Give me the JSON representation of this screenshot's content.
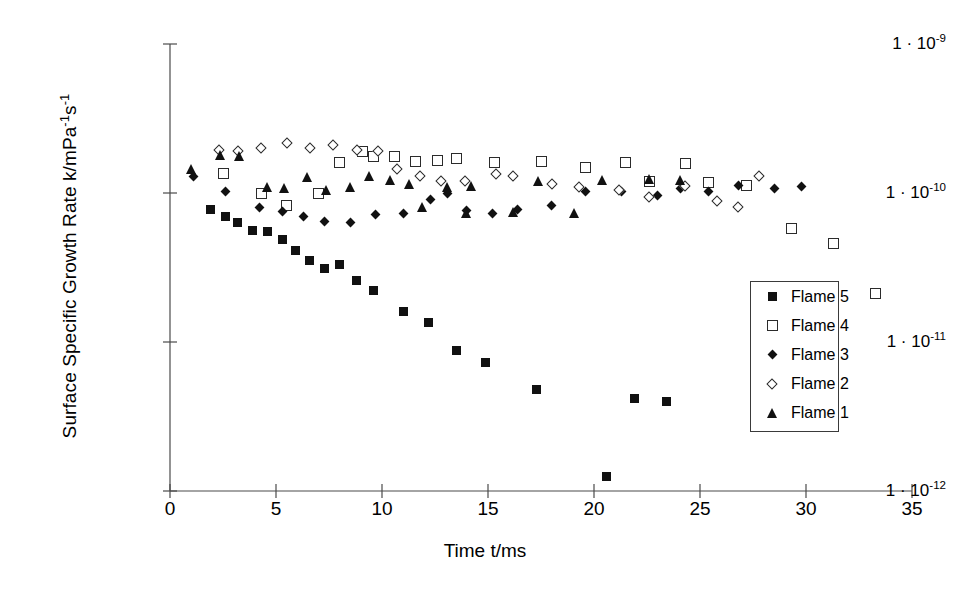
{
  "chart_data": {
    "type": "scatter",
    "title": "",
    "xlabel": "Time t/ms",
    "ylabel": "Surface Specific Growth Rate k/mPa-1s-1",
    "ylabel_parts": [
      {
        "t": "Surface Specific Growth Rate k/mPa"
      },
      {
        "t": "-1",
        "sup": true
      },
      {
        "t": "s"
      },
      {
        "t": "-1",
        "sup": true
      }
    ],
    "xlim": [
      0,
      35
    ],
    "ylim": [
      1e-12,
      1e-09
    ],
    "yscale": "log",
    "xticks": [
      0,
      5,
      10,
      15,
      20,
      25,
      30,
      35
    ],
    "xticklabels": [
      "0",
      "5",
      "10",
      "15",
      "20",
      "25",
      "30",
      "35"
    ],
    "yticks": [
      1e-09,
      1e-10,
      1e-11,
      1e-12
    ],
    "yticklabels": [
      {
        "mantissa": "1 · 10",
        "exp": "-9"
      },
      {
        "mantissa": "1 · 10",
        "exp": "-10"
      },
      {
        "mantissa": "1 · 10",
        "exp": "-11"
      },
      {
        "mantissa": "1 · 10",
        "exp": "-12"
      }
    ],
    "grid": false,
    "legend_position": "center-right",
    "series": [
      {
        "name": "Flame 5",
        "marker": "filled-square",
        "points": [
          [
            1.9,
            7.8e-11
          ],
          [
            2.6,
            7e-11
          ],
          [
            3.2,
            6.3e-11
          ],
          [
            3.9,
            5.6e-11
          ],
          [
            4.6,
            5.5e-11
          ],
          [
            5.3,
            4.9e-11
          ],
          [
            5.9,
            4.1e-11
          ],
          [
            6.6,
            3.5e-11
          ],
          [
            7.3,
            3.1e-11
          ],
          [
            8.0,
            3.3e-11
          ],
          [
            8.8,
            2.6e-11
          ],
          [
            9.6,
            2.2e-11
          ],
          [
            11.0,
            1.6e-11
          ],
          [
            12.2,
            1.35e-11
          ],
          [
            13.5,
            8.8e-12
          ],
          [
            14.9,
            7.3e-12
          ],
          [
            17.3,
            4.8e-12
          ],
          [
            20.6,
            1.25e-12
          ],
          [
            21.9,
            4.2e-12
          ],
          [
            23.4,
            4e-12
          ]
        ]
      },
      {
        "name": "Flame 4",
        "marker": "open-square",
        "points": [
          [
            2.5,
            1.35e-10
          ],
          [
            4.3,
            1e-10
          ],
          [
            5.5,
            8.3e-11
          ],
          [
            7.0,
            9.9e-11
          ],
          [
            8.0,
            1.6e-10
          ],
          [
            9.1,
            1.9e-10
          ],
          [
            9.6,
            1.75e-10
          ],
          [
            10.6,
            1.75e-10
          ],
          [
            11.6,
            1.62e-10
          ],
          [
            12.6,
            1.65e-10
          ],
          [
            13.5,
            1.7e-10
          ],
          [
            15.3,
            1.6e-10
          ],
          [
            17.5,
            1.63e-10
          ],
          [
            19.6,
            1.48e-10
          ],
          [
            21.5,
            1.6e-10
          ],
          [
            22.6,
            1.2e-10
          ],
          [
            24.3,
            1.58e-10
          ],
          [
            25.4,
            1.18e-10
          ],
          [
            27.2,
            1.12e-10
          ],
          [
            29.3,
            5.8e-11
          ],
          [
            31.3,
            4.6e-11
          ],
          [
            33.3,
            2.1e-11
          ]
        ]
      },
      {
        "name": "Flame 3",
        "marker": "filled-diamond",
        "points": [
          [
            1.1,
            1.3e-10
          ],
          [
            2.6,
            1.02e-10
          ],
          [
            4.2,
            8e-11
          ],
          [
            5.3,
            7.5e-11
          ],
          [
            6.3,
            7e-11
          ],
          [
            7.3,
            6.4e-11
          ],
          [
            8.5,
            6.3e-11
          ],
          [
            9.7,
            7.2e-11
          ],
          [
            11.0,
            7.3e-11
          ],
          [
            12.3,
            9e-11
          ],
          [
            13.1,
            1e-10
          ],
          [
            14.0,
            7.6e-11
          ],
          [
            15.2,
            7.3e-11
          ],
          [
            16.4,
            7.8e-11
          ],
          [
            18.0,
            8.3e-11
          ],
          [
            19.6,
            1.03e-10
          ],
          [
            21.3,
            1.02e-10
          ],
          [
            23.0,
            9.6e-11
          ],
          [
            24.1,
            1.08e-10
          ],
          [
            25.4,
            1.02e-10
          ],
          [
            26.8,
            1.12e-10
          ],
          [
            28.5,
            1.08e-10
          ],
          [
            29.8,
            1.1e-10
          ]
        ]
      },
      {
        "name": "Flame 2",
        "marker": "open-diamond",
        "points": [
          [
            2.3,
            1.95e-10
          ],
          [
            3.2,
            1.9e-10
          ],
          [
            4.3,
            2e-10
          ],
          [
            5.5,
            2.15e-10
          ],
          [
            6.6,
            2e-10
          ],
          [
            7.7,
            2.1e-10
          ],
          [
            8.8,
            1.95e-10
          ],
          [
            9.8,
            1.92e-10
          ],
          [
            10.7,
            1.45e-10
          ],
          [
            11.8,
            1.3e-10
          ],
          [
            12.8,
            1.2e-10
          ],
          [
            13.9,
            1.2e-10
          ],
          [
            15.4,
            1.35e-10
          ],
          [
            16.2,
            1.3e-10
          ],
          [
            18.0,
            1.15e-10
          ],
          [
            19.3,
            1.1e-10
          ],
          [
            21.2,
            1.05e-10
          ],
          [
            22.6,
            9.4e-11
          ],
          [
            24.3,
            1.12e-10
          ],
          [
            25.8,
            8.8e-11
          ],
          [
            26.8,
            8e-11
          ],
          [
            27.8,
            1.3e-10
          ]
        ]
      },
      {
        "name": "Flame 1",
        "marker": "filled-triangle",
        "points": [
          [
            1.0,
            1.45e-10
          ],
          [
            2.4,
            1.8e-10
          ],
          [
            3.3,
            1.78e-10
          ],
          [
            4.6,
            1.1e-10
          ],
          [
            5.4,
            1.08e-10
          ],
          [
            6.5,
            1.28e-10
          ],
          [
            7.4,
            1.05e-10
          ],
          [
            8.5,
            1.1e-10
          ],
          [
            9.4,
            1.3e-10
          ],
          [
            10.4,
            1.22e-10
          ],
          [
            11.3,
            1.15e-10
          ],
          [
            11.9,
            8e-11
          ],
          [
            13.1,
            1.1e-10
          ],
          [
            14.2,
            1.12e-10
          ],
          [
            14.0,
            7.3e-11
          ],
          [
            16.2,
            7.5e-11
          ],
          [
            17.4,
            1.2e-10
          ],
          [
            19.1,
            7.3e-11
          ],
          [
            20.4,
            1.22e-10
          ],
          [
            22.6,
            1.25e-10
          ],
          [
            24.1,
            1.22e-10
          ]
        ]
      }
    ]
  },
  "legend": {
    "entries": [
      {
        "label": "Flame 5",
        "marker": "filled-square"
      },
      {
        "label": "Flame 4",
        "marker": "open-square"
      },
      {
        "label": "Flame 3",
        "marker": "filled-diamond"
      },
      {
        "label": "Flame 2",
        "marker": "open-diamond"
      },
      {
        "label": "Flame 1",
        "marker": "filled-triangle"
      }
    ]
  },
  "style": {
    "axis_color": "#4a4a4a",
    "marker_color": "#111111",
    "background": "#ffffff"
  }
}
